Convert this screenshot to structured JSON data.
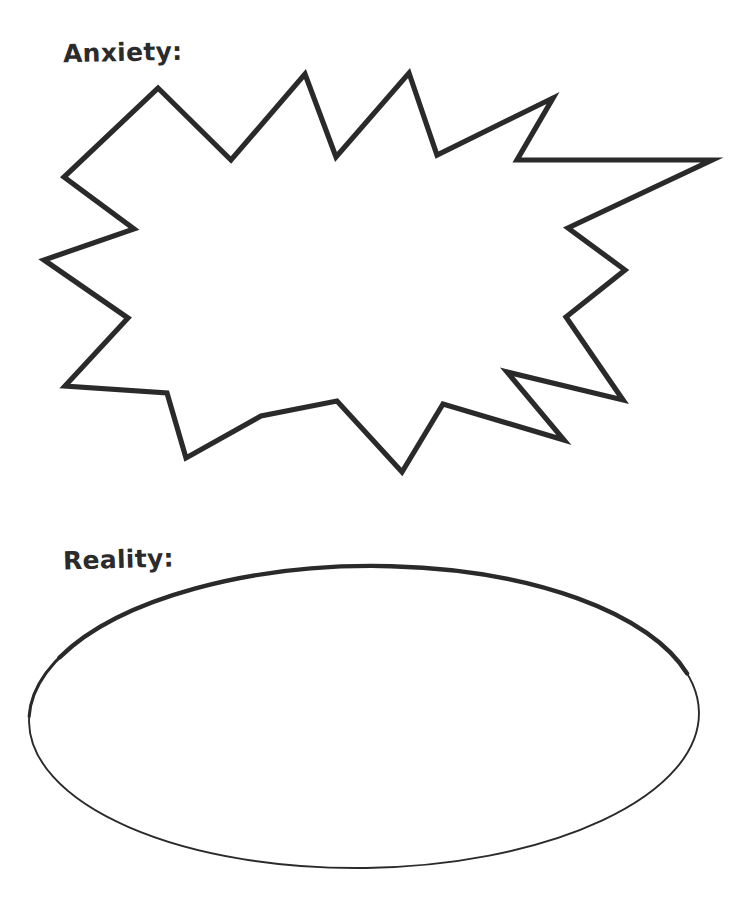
{
  "page": {
    "background_color": "#ffffff",
    "ink_color": "#2b2b2b",
    "width": 746,
    "height": 906
  },
  "sections": [
    {
      "id": "anxiety",
      "label": "Anxiety:",
      "shape": "starburst",
      "shape_name": "jagged explosion burst outline",
      "fill": "#ffffff",
      "stroke": "#2b2b2b",
      "spike_count": 14,
      "bounds": {
        "x": 42,
        "y": 70,
        "width": 672,
        "height": 410
      }
    },
    {
      "id": "reality",
      "label": "Reality:",
      "shape": "ellipse",
      "shape_name": "oval outline",
      "fill": "#ffffff",
      "stroke": "#2b2b2b",
      "bounds": {
        "x": 29,
        "y": 566,
        "width": 670,
        "height": 303
      }
    }
  ],
  "shape_geometry": {
    "starburst_points": "158,88 231,160 305,74 336,157 409,73 437,155 553,98 517,160 712,160 568,228 625,270 566,317 623,400 507,372 564,440 443,404 402,472 337,401 261,416 186,458 167,393 65,386 128,318 44,260 134,229 64,177",
    "ellipse_center": {
      "cx": 364,
      "cy": 717
    },
    "ellipse_radii": {
      "rx": 335,
      "ry": 151
    },
    "ellipse_rotation_deg": -0.8
  }
}
